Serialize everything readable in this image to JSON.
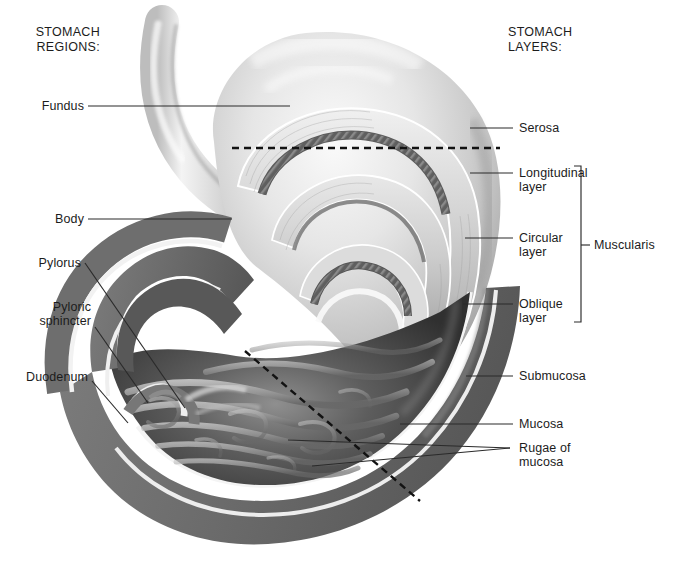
{
  "figure": {
    "style": "grayscale medical illustration"
  },
  "headings": {
    "left": "STOMACH\nREGIONS:",
    "right": "STOMACH\nLAYERS:"
  },
  "regions": [
    {
      "id": "fundus",
      "label": "Fundus",
      "x": 38,
      "y": 101,
      "align": "right",
      "leader": [
        [
          88,
          106
        ],
        [
          290,
          106
        ]
      ]
    },
    {
      "id": "body",
      "label": "Body",
      "x": 52,
      "y": 214,
      "align": "right",
      "leader": [
        [
          88,
          219
        ],
        [
          232,
          219
        ]
      ]
    },
    {
      "id": "pylorus",
      "label": "Pylorus",
      "x": 33,
      "y": 258,
      "align": "right",
      "leader": [
        [
          85,
          263
        ],
        [
          185,
          408
        ]
      ]
    },
    {
      "id": "pyloric-sphincter",
      "label": "Pyloric\nsphincter",
      "x": 50,
      "y": 303,
      "align": "right",
      "leader": [
        [
          95,
          327
        ],
        [
          148,
          403
        ]
      ]
    },
    {
      "id": "duodenum",
      "label": "Duodenum",
      "x": 28,
      "y": 372,
      "align": "right",
      "leader": [
        [
          92,
          381
        ],
        [
          128,
          423
        ]
      ]
    }
  ],
  "layers": [
    {
      "id": "serosa",
      "label": "Serosa",
      "x": 519,
      "y": 122,
      "leader": [
        [
          500,
          128
        ],
        [
          470,
          128
        ]
      ]
    },
    {
      "id": "longitudinal-layer",
      "label": "Longitudinal\nlayer",
      "x": 519,
      "y": 166,
      "leader": [
        [
          513,
          173
        ],
        [
          470,
          173
        ]
      ]
    },
    {
      "id": "circular-layer",
      "label": "Circular\nlayer",
      "x": 519,
      "y": 231,
      "leader": [
        [
          513,
          238
        ],
        [
          465,
          238
        ]
      ]
    },
    {
      "id": "oblique-layer",
      "label": "Oblique\nlayer",
      "x": 519,
      "y": 297,
      "leader": [
        [
          513,
          304
        ],
        [
          463,
          304
        ]
      ]
    },
    {
      "id": "submucosa",
      "label": "Submucosa",
      "x": 519,
      "y": 370,
      "leader": [
        [
          513,
          376
        ],
        [
          466,
          376
        ]
      ]
    },
    {
      "id": "mucosa",
      "label": "Mucosa",
      "x": 519,
      "y": 418,
      "leader": [
        [
          513,
          424
        ],
        [
          400,
          424
        ]
      ]
    },
    {
      "id": "rugae-of-mucosa",
      "label": "Rugae of\nmucosa",
      "x": 519,
      "y": 446,
      "leaders": [
        [
          [
            510,
            448
          ],
          [
            288,
            440
          ]
        ],
        [
          [
            510,
            448
          ],
          [
            312,
            466
          ]
        ]
      ]
    }
  ],
  "bracket": {
    "label": "Muscularis",
    "label_x": 596,
    "label_y": 239,
    "x": 581,
    "top": 166,
    "bottom": 322,
    "tick_y": 245
  },
  "dashed_lines": [
    {
      "id": "horizontal-cut-line",
      "points": [
        [
          232,
          148
        ],
        [
          500,
          148
        ]
      ]
    },
    {
      "id": "diagonal-cut-line",
      "points": [
        [
          245,
          351
        ],
        [
          420,
          501
        ]
      ]
    }
  ],
  "colors": {
    "ink": "#1c1c1c",
    "leader": "#2a2a2a",
    "wall_muscle": "#6f6f6f",
    "wall_highlight": "#f2f2f2",
    "lumen_dark": "#3a3a3a",
    "serosa_light": "#cfcfcf",
    "oblique_band": "#5a5a5a",
    "background": "#ffffff"
  }
}
